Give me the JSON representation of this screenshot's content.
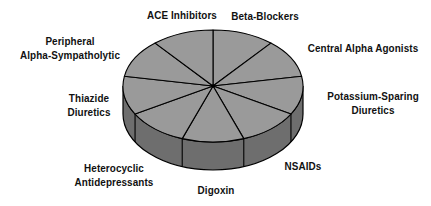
{
  "chart_data": {
    "type": "pie",
    "style": "3d",
    "title": "",
    "slice_count": 9,
    "equal_slices": true,
    "categories": [
      "Beta-Blockers",
      "Central Alpha Agonists",
      "Potassium-Sparing Diuretics",
      "NSAIDs",
      "Digoxin",
      "Heterocyclic Antidepressants",
      "Thiazide Diuretics",
      "Peripheral Alpha-Sympatholytic",
      "ACE Inhibitors"
    ],
    "values": [
      1,
      1,
      1,
      1,
      1,
      1,
      1,
      1,
      1
    ],
    "colors": {
      "top": "#9a9a9a",
      "side": "#6e6e6e",
      "outline": "#000000"
    },
    "legend": "none",
    "labels_position": "outside"
  },
  "labels": {
    "ace": [
      "ACE Inhibitors"
    ],
    "beta": [
      "Beta-Blockers"
    ],
    "central": [
      "Central Alpha Agonists"
    ],
    "peripheral": [
      "Peripheral",
      "Alpha-Sympatholytic"
    ],
    "potassium": [
      "Potassium-Sparing",
      "Diuretics"
    ],
    "thiazide": [
      "Thiazide",
      "Diuretics"
    ],
    "nsaids": [
      "NSAIDs"
    ],
    "heterocyclic": [
      "Heterocyclic",
      "Antidepressants"
    ],
    "digoxin": [
      "Digoxin"
    ]
  }
}
